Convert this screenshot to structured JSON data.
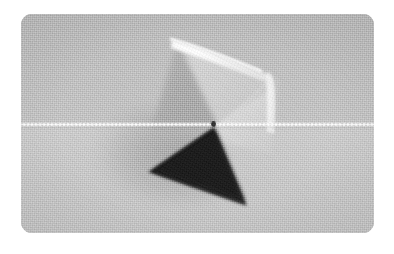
{
  "figure": {
    "kind": "photograph",
    "color_mode": "grayscale",
    "caption": "",
    "frame": {
      "x": 21,
      "y": 14,
      "width": 353,
      "height": 219,
      "corner_radius": 11,
      "page_background": "#ffffff"
    },
    "background": {
      "material": "woven canvas / linen cloth",
      "upper_tone": "#b8b8b8",
      "lower_tone": "#c3c3c3",
      "texture": "fine square weave"
    },
    "subject": {
      "name": "folded translucent pyramid",
      "description": "A tetrahedral paper or translucent plastic form standing on a cloth surface, lit from the upper right so one face reads light gray and the near face falls into deep shadow.",
      "faces": [
        {
          "id": "upper-light-face",
          "label": "upper light face",
          "tone": "#a6a6a6",
          "note": "large soft triangular face occupying the upper middle"
        },
        {
          "id": "right-translucent-panel",
          "label": "right translucent panel",
          "tone": "#cfcfcf",
          "note": "pale translucent flap folding back to the right"
        },
        {
          "id": "lower-dark-face",
          "label": "lower dark face",
          "tone": "#1d1d1d",
          "note": "strongly shadowed triangle below the thread"
        }
      ],
      "highlights": [
        {
          "id": "top-fold-highlight",
          "label": "top fold highlight",
          "tone": "#ffffff",
          "note": "bright specular streak along the upper folded edge"
        },
        {
          "id": "right-edge-highlight",
          "label": "right edge highlight",
          "tone": "#f2f2f2",
          "note": "vertical bright crease descending on the right"
        }
      ],
      "shadow": {
        "id": "cast-shadow",
        "label": "cast shadow",
        "note": "diffuse shadow spilling to the lower left"
      }
    },
    "thread": {
      "label": "horizontal white thread",
      "tone": "#ffffff",
      "y_position": 125,
      "note": "a taut white filament crossing the entire frame and passing through the apex of the form"
    },
    "knot": {
      "label": "dark knot at apex",
      "tone": "#2b2b2b"
    }
  }
}
